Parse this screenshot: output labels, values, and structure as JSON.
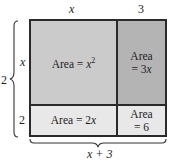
{
  "diagram": {
    "top_labels": {
      "left": "x",
      "right": "3"
    },
    "side_labels": {
      "top": "x",
      "bottom": "2"
    },
    "left_total": {
      "text": "2",
      "partial_note": "x + 2 (cut off)"
    },
    "bottom_total": {
      "text": "x + 3"
    },
    "cells": {
      "top_left": {
        "prefix": "Area = ",
        "var": "x",
        "sup": "2"
      },
      "top_right": {
        "line1": "Area",
        "line2_prefix": "= 3",
        "line2_var": "x"
      },
      "bottom_left": {
        "prefix": "Area = 2",
        "var": "x"
      },
      "bottom_right": {
        "line1": "Area",
        "line2": "= 6"
      }
    },
    "colors": {
      "top_left": "#cbcbcb",
      "top_right": "#b4b4b4",
      "bottom_left": "#e8e8e8",
      "bottom_right": "#e8e8e8",
      "lines": "#2a2a2a"
    }
  }
}
